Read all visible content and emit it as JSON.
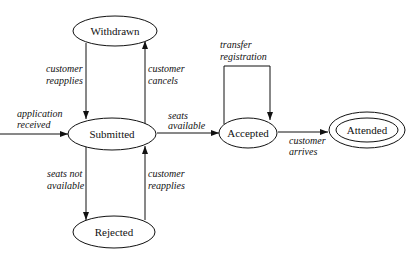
{
  "diagram": {
    "type": "state-transition",
    "states": [
      {
        "id": "withdrawn",
        "label": "Withdrawn",
        "cx": 115,
        "cy": 31,
        "rx": 42,
        "ry": 15,
        "final": false
      },
      {
        "id": "submitted",
        "label": "Submitted",
        "cx": 112,
        "cy": 134,
        "rx": 44,
        "ry": 16,
        "final": false
      },
      {
        "id": "rejected",
        "label": "Rejected",
        "cx": 114,
        "cy": 232,
        "rx": 41,
        "ry": 16,
        "final": false
      },
      {
        "id": "accepted",
        "label": "Accepted",
        "cx": 248,
        "cy": 133,
        "rx": 29,
        "ry": 15,
        "final": false
      },
      {
        "id": "attended",
        "label": "Attended",
        "cx": 367,
        "cy": 130,
        "rx": 38,
        "ry": 18,
        "final": true
      }
    ],
    "transitions": [
      {
        "from": "start",
        "to": "submitted",
        "label_lines": [
          "application",
          "received"
        ]
      },
      {
        "from": "withdrawn",
        "to": "submitted",
        "label_lines": [
          "customer",
          "reapplies"
        ]
      },
      {
        "from": "submitted",
        "to": "withdrawn",
        "label_lines": [
          "customer",
          "cancels"
        ]
      },
      {
        "from": "submitted",
        "to": "accepted",
        "label_lines": [
          "seats",
          "available"
        ]
      },
      {
        "from": "submitted",
        "to": "rejected",
        "label_lines": [
          "seats not",
          "available"
        ]
      },
      {
        "from": "rejected",
        "to": "submitted",
        "label_lines": [
          "customer",
          "reapplies"
        ]
      },
      {
        "from": "accepted",
        "to": "accepted",
        "label_lines": [
          "transfer",
          "registration"
        ]
      },
      {
        "from": "accepted",
        "to": "attended",
        "label_lines": [
          "customer",
          "arrives"
        ]
      }
    ]
  }
}
